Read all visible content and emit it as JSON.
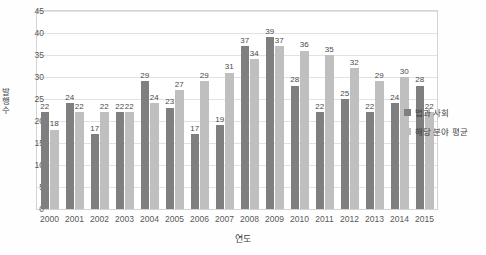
{
  "chart_data": {
    "type": "bar",
    "title": "",
    "xlabel": "연도",
    "ylabel": "발행 수",
    "ylim": [
      0,
      45
    ],
    "yticks": [
      0,
      5,
      10,
      15,
      20,
      25,
      30,
      35,
      40,
      45
    ],
    "grid": true,
    "legend_position": "right",
    "categories": [
      "2000",
      "2001",
      "2002",
      "2003",
      "2004",
      "2005",
      "2006",
      "2007",
      "2008",
      "2009",
      "2010",
      "2011",
      "2012",
      "2013",
      "2014",
      "2015"
    ],
    "series": [
      {
        "name": "법과 사회",
        "color": "#7f7f7f",
        "values": [
          22,
          24,
          17,
          22,
          29,
          23,
          17,
          19,
          37,
          39,
          28,
          22,
          25,
          22,
          24,
          28
        ]
      },
      {
        "name": "해당 분야 평균",
        "color": "#bfbfbf",
        "values": [
          18,
          22,
          22,
          22,
          24,
          27,
          29,
          31,
          34,
          37,
          36,
          35,
          32,
          29,
          30,
          22
        ]
      }
    ]
  },
  "ylabel_chars": [
    "발",
    "행",
    "수"
  ]
}
